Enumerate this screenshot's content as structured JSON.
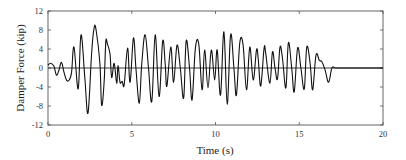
{
  "chart_data": {
    "type": "line",
    "title": "",
    "xlabel": "Time (s)",
    "ylabel": "Damper Force (kip)",
    "xlim": [
      0,
      20
    ],
    "ylim": [
      -12,
      12
    ],
    "xticks": [
      0,
      5,
      10,
      15,
      20
    ],
    "yticks": [
      12,
      8,
      4,
      0,
      -4,
      -8,
      -12
    ],
    "grid": false,
    "legend": null,
    "zero_line": true,
    "series": [
      {
        "name": "Damper Force",
        "color": "#111111",
        "x": [
          0.0,
          0.15,
          0.35,
          0.5,
          0.65,
          0.8,
          0.95,
          1.1,
          1.25,
          1.4,
          1.55,
          1.8,
          1.97,
          2.2,
          2.39,
          2.6,
          2.75,
          2.87,
          3.1,
          3.2,
          3.35,
          3.45,
          3.55,
          3.7,
          3.8,
          3.95,
          4.1,
          4.18,
          4.3,
          4.43,
          4.55,
          4.75,
          4.9,
          5.1,
          5.25,
          5.45,
          5.6,
          5.8,
          6.0,
          6.2,
          6.4,
          6.63,
          6.85,
          7.0,
          7.1,
          7.33,
          7.5,
          7.7,
          7.9,
          8.1,
          8.25,
          8.45,
          8.6,
          8.8,
          9.0,
          9.2,
          9.35,
          9.55,
          9.75,
          9.95,
          10.1,
          10.3,
          10.5,
          10.7,
          10.9,
          11.1,
          11.25,
          11.45,
          11.65,
          11.85,
          12.05,
          12.25,
          12.45,
          12.55,
          12.7,
          12.9,
          13.0,
          13.25,
          13.4,
          13.55,
          13.7,
          13.85,
          14.0,
          14.2,
          14.35,
          14.55,
          14.7,
          14.9,
          15.1,
          15.3,
          15.45,
          15.65,
          15.8,
          16.0,
          16.2,
          16.35,
          16.55,
          16.75,
          16.95,
          17.15,
          17.35,
          17.5,
          17.7,
          17.9,
          18.1,
          18.3,
          18.5,
          18.65,
          18.85,
          19.0,
          19.2,
          19.4,
          19.6,
          19.75,
          19.9,
          20.0
        ],
        "y": [
          0.6,
          1.0,
          0.4,
          -1.5,
          -0.5,
          1.2,
          -0.8,
          -2.5,
          -2.6,
          -1.0,
          4.4,
          -4.4,
          7.0,
          -2.0,
          -9.5,
          3.0,
          8.4,
          8.0,
          1.0,
          -7.8,
          -3.0,
          5.5,
          5.0,
          3.0,
          -2.0,
          1.0,
          -3.2,
          0.5,
          -3.0,
          -2.8,
          -3.5,
          4.2,
          -3.0,
          6.3,
          0.0,
          -7.4,
          1.0,
          7.0,
          0.0,
          -7.0,
          7.0,
          -6.0,
          5.7,
          0.5,
          -3.8,
          4.4,
          -3.0,
          4.8,
          0.0,
          -6.3,
          5.7,
          0.0,
          -6.7,
          4.2,
          5.0,
          -4.6,
          3.8,
          -4.2,
          3.8,
          -2.5,
          3.8,
          -5.7,
          7.6,
          -7.6,
          7.0,
          0.0,
          -5.7,
          5.3,
          4.8,
          -4.6,
          4.4,
          -2.5,
          3.8,
          2.0,
          -3.8,
          4.2,
          3.0,
          -3.2,
          3.4,
          0.0,
          -2.3,
          4.4,
          2.0,
          -4.2,
          5.3,
          0.0,
          -5.0,
          4.2,
          0.0,
          -4.4,
          4.4,
          1.0,
          -4.6,
          2.7,
          1.6,
          1.3,
          -0.5,
          -3.0,
          0.0,
          0.0,
          0.0,
          0.0,
          0.0,
          0.0,
          0.0,
          0.0,
          0.0,
          0.0,
          0.0,
          0.0,
          0.0,
          0.0,
          0.0,
          0.0,
          0.0,
          0.0
        ]
      }
    ]
  },
  "axes": {
    "x_title": "Time (s)",
    "y_title": "Damper Force (kip)",
    "x_tick_labels": [
      "0",
      "5",
      "10",
      "15",
      "20"
    ],
    "y_tick_labels": [
      "12",
      "8",
      "4",
      "0",
      "-4",
      "-8",
      "-12"
    ]
  }
}
